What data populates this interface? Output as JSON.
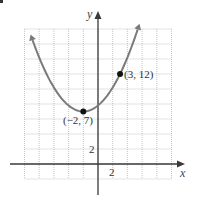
{
  "chart_data": {
    "type": "line",
    "title": "",
    "xlabel": "x",
    "ylabel": "y",
    "xlim": [
      -10,
      10
    ],
    "ylim": [
      -2,
      18
    ],
    "grid": true,
    "grid_step": 2,
    "x_tick_labels": [
      {
        "value": 2,
        "label": "2"
      }
    ],
    "y_tick_labels": [
      {
        "value": 2,
        "label": "2"
      }
    ],
    "equation": "y = 0.2(x + 2)^2 + 7",
    "series": [
      {
        "name": "parabola",
        "kind": "quadratic",
        "a": 0.2,
        "h": -2,
        "k": 7,
        "x_range": [
          -8.9,
          5.4
        ],
        "arrows_both_ends": true,
        "color": "#7a7a7a"
      }
    ],
    "points": [
      {
        "x": -2,
        "y": 7,
        "label": "(−2, 7)",
        "role": "vertex"
      },
      {
        "x": 3,
        "y": 12,
        "label": "(3, 12)",
        "role": "point"
      }
    ]
  },
  "labels": {
    "x_axis": "x",
    "y_axis": "y",
    "x_tick": "2",
    "y_tick": "2",
    "vertex": "(−2, 7)",
    "point": "(3, 12)"
  },
  "colors": {
    "curve": "#7a7a7a",
    "axis": "#3a3a3a",
    "grid": "#b8b8b8",
    "point": "#111111"
  }
}
